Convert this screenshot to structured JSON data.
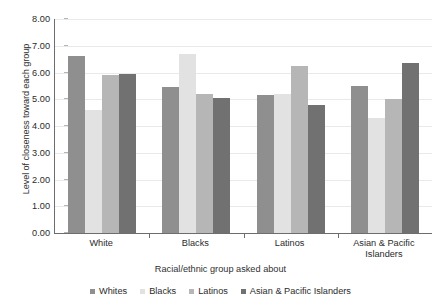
{
  "chart_data": {
    "type": "bar",
    "title": "",
    "xlabel": "Racial/ethnic group asked about",
    "ylabel": "Level of closeness toward each group",
    "categories": [
      "White",
      "Blacks",
      "Latinos",
      "Asian & Pacific Islanders"
    ],
    "ylim": [
      0.0,
      8.0
    ],
    "ytick_step": 1.0,
    "ytick_labels": [
      "0.00",
      "1.00",
      "2.00",
      "3.00",
      "4.00",
      "5.00",
      "6.00",
      "7.00",
      "8.00"
    ],
    "grid": true,
    "grid_axis": "y",
    "legend_position": "bottom",
    "series": [
      {
        "name": "Whites",
        "color": "#8f8f8f",
        "values": [
          6.6,
          5.45,
          5.15,
          5.5
        ]
      },
      {
        "name": "Blacks",
        "color": "#e2e2e2",
        "values": [
          4.6,
          6.7,
          5.2,
          4.3
        ]
      },
      {
        "name": "Latinos",
        "color": "#b6b6b6",
        "values": [
          5.9,
          5.2,
          6.25,
          5.0
        ]
      },
      {
        "name": "Asian & Pacific Islanders",
        "color": "#717171",
        "values": [
          5.95,
          5.05,
          4.8,
          6.35
        ]
      }
    ]
  },
  "axis": {
    "y_title": "Level of closeness toward each group",
    "x_title": "Racial/ethnic group asked about"
  },
  "legend": {
    "items": [
      {
        "label": "Whites"
      },
      {
        "label": "Blacks"
      },
      {
        "label": "Latinos"
      },
      {
        "label": "Asian & Pacific Islanders"
      }
    ]
  }
}
